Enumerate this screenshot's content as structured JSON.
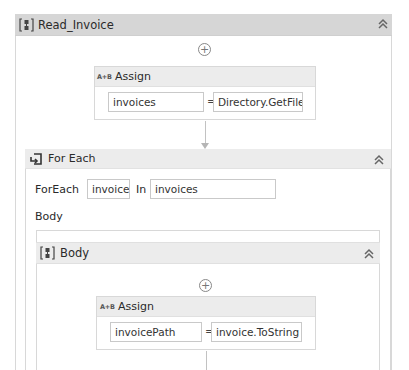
{
  "sequence": {
    "title": "Read_Invoice",
    "icon": "sequence-icon",
    "collapse_icon": "double-chevron-up-icon"
  },
  "assign1": {
    "label": "Assign",
    "icon_text": "A+B",
    "to": "invoices",
    "equals": "=",
    "value": "Directory.GetFiles(c"
  },
  "foreach": {
    "title": "For Each",
    "icon": "foreach-icon",
    "foreach_label": "ForEach",
    "item": "invoice",
    "in_label": "In",
    "collection": "invoices",
    "body_label": "Body",
    "collapse_icon": "double-chevron-up-icon"
  },
  "body_seq": {
    "title": "Body",
    "icon": "sequence-icon",
    "collapse_icon": "double-chevron-up-icon"
  },
  "assign2": {
    "label": "Assign",
    "icon_text": "A+B",
    "to": "invoicePath",
    "equals": "=",
    "value": "invoice.ToString"
  },
  "icons": {
    "plus": "+",
    "chevron": "˄˄"
  },
  "colors": {
    "header_bg": "#d6d6d6",
    "activity_header_bg": "#ececec",
    "border": "#d8d8d8"
  }
}
